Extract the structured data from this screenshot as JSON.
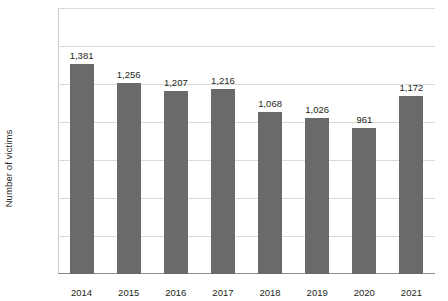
{
  "chart_data": {
    "type": "bar",
    "title": "",
    "xlabel": "",
    "ylabel": "Number of victims",
    "categories": [
      "2014",
      "2015",
      "2016",
      "2017",
      "2018",
      "2019",
      "2020",
      "2021"
    ],
    "values": [
      1381,
      1256,
      1207,
      1216,
      1068,
      1026,
      961,
      1172
    ],
    "value_labels": [
      "1,381",
      "1,256",
      "1,207",
      "1,216",
      "1,068",
      "1,026",
      "961",
      "1,172"
    ],
    "ylim": [
      0,
      1750
    ],
    "yticks": [
      0,
      250,
      500,
      750,
      1000,
      1250,
      1500,
      1750
    ],
    "ytick_labels": [
      "0",
      "250",
      "500",
      "750",
      "1,000",
      "1,250",
      "1,500",
      "1,750"
    ],
    "grid": true,
    "legend": "none",
    "bar_color": "#6a6a6a",
    "gridline_color": "#d9d9d9",
    "axis_color": "#8c8c8c",
    "text_color": "#231f20",
    "background_color": "#ffffff"
  }
}
